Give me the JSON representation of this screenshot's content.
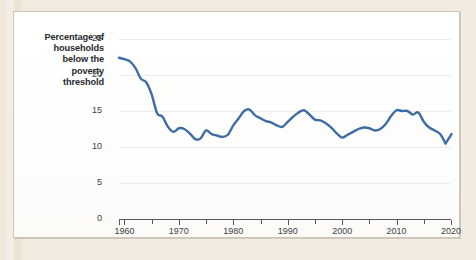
{
  "chart_data": {
    "type": "line",
    "title": "",
    "subtitle": "",
    "xlabel": "",
    "ylabel": "Percentage of households below the poverty threshold",
    "ylabel_lines": [
      "Percentage of",
      "households",
      "below the",
      "poverty",
      "threshold"
    ],
    "xlim": [
      1959,
      2020
    ],
    "ylim": [
      0,
      25
    ],
    "yticks": [
      0,
      5,
      10,
      15,
      20,
      25
    ],
    "ytick_labels": [
      "0",
      "5",
      "10",
      "15",
      "20",
      "25"
    ],
    "xticks": [
      1960,
      1965,
      1970,
      1975,
      1980,
      1985,
      1990,
      1995,
      2000,
      2005,
      2010,
      2015,
      2020
    ],
    "xtick_labels": [
      "1960",
      "1970",
      "1980",
      "1990",
      "2000",
      "2010",
      "2020"
    ],
    "xtick_label_values": [
      1960,
      1970,
      1980,
      1990,
      2000,
      2010,
      2020
    ],
    "grid": true,
    "grid_axis": "y",
    "legend": false,
    "legend_position": "none",
    "line_color": "#3d6da4",
    "line_width": 2.4,
    "series": [
      {
        "name": "Percentage of households below the poverty threshold",
        "x": [
          1959,
          1960,
          1961,
          1962,
          1963,
          1964,
          1965,
          1966,
          1967,
          1968,
          1969,
          1970,
          1971,
          1972,
          1973,
          1974,
          1975,
          1976,
          1977,
          1978,
          1979,
          1980,
          1981,
          1982,
          1983,
          1984,
          1985,
          1986,
          1987,
          1988,
          1989,
          1990,
          1991,
          1992,
          1993,
          1994,
          1995,
          1996,
          1997,
          1998,
          1999,
          2000,
          2001,
          2002,
          2003,
          2004,
          2005,
          2006,
          2007,
          2008,
          2009,
          2010,
          2011,
          2012,
          2013,
          2014,
          2015,
          2016,
          2017,
          2018,
          2019
        ],
        "values": [
          22.4,
          22.2,
          21.9,
          21.0,
          19.5,
          19.0,
          17.3,
          14.7,
          14.2,
          12.8,
          12.1,
          12.6,
          12.5,
          11.9,
          11.1,
          11.2,
          12.3,
          11.8,
          11.6,
          11.4,
          11.7,
          13.0,
          14.0,
          15.0,
          15.2,
          14.4,
          14.0,
          13.6,
          13.4,
          13.0,
          12.8,
          13.5,
          14.2,
          14.8,
          15.1,
          14.5,
          13.8,
          13.7,
          13.3,
          12.7,
          11.9,
          11.3,
          11.7,
          12.1,
          12.5,
          12.7,
          12.6,
          12.3,
          12.5,
          13.2,
          14.3,
          15.1,
          15.0,
          15.0,
          14.5,
          14.8,
          13.5,
          12.7,
          12.3,
          11.8,
          10.5
        ],
        "last_point_value": 11.8,
        "color": "#3d6da4"
      }
    ],
    "colors": {
      "line": "#3d6da4",
      "axis": "#55595c",
      "gridline": "#eceaea",
      "tick_text": "#3d4044",
      "axis_title": "#262a2e",
      "card_background": "#fdfdfb",
      "card_border": "#c9c6bd",
      "page_background": "#f2ece0"
    }
  }
}
